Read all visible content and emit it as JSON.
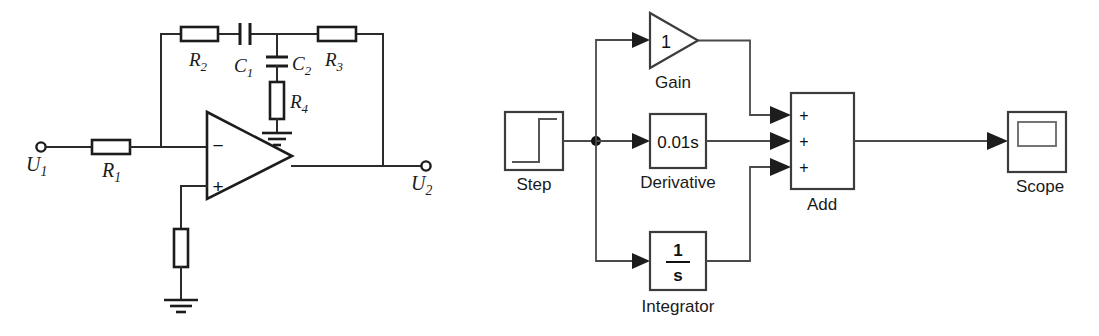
{
  "figure": {
    "panels": [
      "op-amp-pid-circuit",
      "simulink-pid-block-diagram"
    ],
    "background_color": "#ffffff",
    "line_color": "#1c1c1c"
  },
  "circuit": {
    "title": "Operational amplifier PID network",
    "input_terminal": {
      "label_main": "U",
      "label_sub": "1"
    },
    "output_terminal": {
      "label_main": "U",
      "label_sub": "2"
    },
    "opamp": {
      "inverting_input_sign": "−",
      "noninverting_input_sign": "+"
    },
    "components": [
      {
        "id": "R1",
        "type": "resistor",
        "label_main": "R",
        "label_sub": "1"
      },
      {
        "id": "R2",
        "type": "resistor",
        "label_main": "R",
        "label_sub": "2"
      },
      {
        "id": "R3",
        "type": "resistor",
        "label_main": "R",
        "label_sub": "3"
      },
      {
        "id": "R4",
        "type": "resistor",
        "label_main": "R",
        "label_sub": "4"
      },
      {
        "id": "C1",
        "type": "capacitor",
        "label_main": "C",
        "label_sub": "1"
      },
      {
        "id": "C2",
        "type": "capacitor",
        "label_main": "C",
        "label_sub": "2"
      },
      {
        "id": "Rbias",
        "type": "resistor",
        "label_main": "",
        "label_sub": ""
      }
    ],
    "grounds": 2
  },
  "blocks": {
    "title": "Simulink PID model",
    "step": {
      "name": "Step",
      "icon": "step-waveform-icon"
    },
    "gain": {
      "name": "Gain",
      "value": "1",
      "shape": "triangle"
    },
    "derivative": {
      "name": "Derivative",
      "value": "0.01s",
      "shape": "rect"
    },
    "integrator": {
      "name": "Integrator",
      "numerator": "1",
      "denominator": "s",
      "shape": "rect"
    },
    "add": {
      "name": "Add",
      "signs": [
        "+",
        "+",
        "+"
      ],
      "shape": "rect"
    },
    "scope": {
      "name": "Scope",
      "icon": "scope-screen-icon"
    },
    "signal_flow": [
      "Step",
      "Gain",
      "Derivative",
      "Integrator",
      "Add",
      "Scope"
    ]
  }
}
